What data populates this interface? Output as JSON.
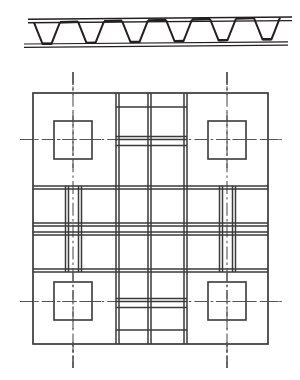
{
  "figure": {
    "background_color": "#ffffff",
    "line_color": "#231f20",
    "centerline_color": "#4a4a4a",
    "width": 300,
    "height": 380
  },
  "elevation": {
    "name": "corrugated-panel-section",
    "top_plate": {
      "y_outer": 19.0,
      "y_inner": 23.0,
      "x_start": 28,
      "x_end": 292
    },
    "bottom_plate": {
      "y_outer": 47.0,
      "y_inner": 43.5,
      "x_start": 24,
      "x_end": 288
    },
    "web_thickness": 2.0,
    "trough_count": 5,
    "trough_top_width": 26,
    "trough_bottom_width": 9,
    "trough_pitch": 44,
    "first_trough_left_x": 34,
    "skew_dy": -2.0,
    "profile_note": "trapezoidal corrugation between two parallel face plates"
  },
  "plan": {
    "name": "grid-plan-view",
    "outer_frame": {
      "x": 33,
      "y": 93,
      "w": 235,
      "h": 251
    },
    "line_weight_heavy": 1.6,
    "line_weight_light": 1.0,
    "band_pairs_gap": 3.0,
    "vertical_bands": [
      {
        "name": "left-inner-band",
        "x1": 65,
        "x2": 68
      },
      {
        "name": "center-band-left-edge",
        "x1": 116,
        "x2": 119
      },
      {
        "name": "center-band-mid",
        "x1": 148,
        "x2": 151
      },
      {
        "name": "center-band-right-edge",
        "x1": 184,
        "x2": 187
      },
      {
        "name": "right-inner-band",
        "x1": 233,
        "x2": 236
      }
    ],
    "horizontal_bands": [
      {
        "name": "upper-band-top",
        "y1": 186,
        "y2": 189
      },
      {
        "name": "mid-band-upper",
        "y1": 223,
        "y2": 226
      },
      {
        "name": "mid-band-lower",
        "y1": 232,
        "y2": 235
      },
      {
        "name": "lower-band-bottom",
        "y1": 269,
        "y2": 272
      }
    ],
    "center_cross_band": {
      "y1": 212,
      "y2": 215
    },
    "corner_squares": [
      {
        "name": "square-top-left",
        "x": 54,
        "y": 121,
        "size": 38
      },
      {
        "name": "square-top-right",
        "x": 208,
        "y": 121,
        "size": 38
      },
      {
        "name": "square-bottom-left",
        "x": 54,
        "y": 282,
        "size": 38
      },
      {
        "name": "square-bottom-right",
        "x": 208,
        "y": 282,
        "size": 38
      }
    ],
    "vertical_centerlines": [
      {
        "name": "centerline-vertical-left",
        "x": 73,
        "y_start": 72,
        "y_end": 368
      },
      {
        "name": "centerline-vertical-right",
        "x": 227,
        "y_start": 72,
        "y_end": 368
      }
    ],
    "horizontal_centerlines": [
      {
        "name": "centerline-horizontal-upper",
        "y": 139,
        "x_start": 20,
        "x_end": 282
      },
      {
        "name": "centerline-horizontal-lower",
        "y": 301,
        "x_start": 20,
        "x_end": 282
      }
    ],
    "center_panel_inner_lines": [
      {
        "name": "center-inner-top",
        "y": 139
      },
      {
        "name": "center-inner-bottom",
        "y": 145
      }
    ]
  }
}
